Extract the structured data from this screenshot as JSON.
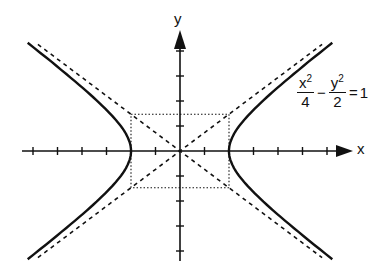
{
  "diagram": {
    "type": "hyperbola-graph",
    "axes": {
      "x_label": "x",
      "y_label": "y",
      "origin_px": [
        180,
        151
      ],
      "unit_px_x": 24.5,
      "unit_px_y": 26,
      "x_ticks_units": [
        -6,
        -5,
        -4,
        -3,
        -2,
        -1,
        1,
        2,
        3,
        4,
        5,
        6
      ],
      "y_ticks_units": [
        -4,
        -3,
        -2,
        -1,
        1,
        2,
        3,
        4
      ]
    },
    "equation": {
      "term1_num": "x",
      "term1_exp": "2",
      "term1_den": "4",
      "operator": "−",
      "term2_num": "y",
      "term2_exp": "2",
      "term2_den": "2",
      "equals": "=",
      "rhs": "1"
    },
    "hyperbola": {
      "a": 2,
      "b": 1.4142,
      "t_max": 1.8
    },
    "asymptotes": {
      "slope": 0.7071,
      "style": "dashed"
    },
    "central_rectangle": {
      "half_width_units": 2,
      "half_height_units": 1.4142,
      "style": "dotted"
    },
    "colors": {
      "ink": "#111111",
      "background": "#ffffff"
    }
  }
}
